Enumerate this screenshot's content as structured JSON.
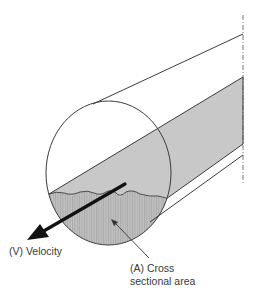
{
  "diagram": {
    "type": "pipe-flow-cross-section",
    "labels": {
      "velocity": "(V) Velocity",
      "area_line1": "(A) Cross",
      "area_line2": "sectional area"
    },
    "colors": {
      "background": "#ffffff",
      "outline": "#3c3c3c",
      "flow_band_fill": "#c8c8c8",
      "cross_section_fill": "#bdbdbd",
      "hatch_stripe": "#a9a9a9",
      "arrow": "#111111",
      "text": "#3a3a3a"
    },
    "elements": [
      "pipe-outline-upper-line",
      "pipe-outline-lower-line",
      "pipe-end-circle",
      "flow-band",
      "water-surface-line",
      "cross-section-area",
      "velocity-arrow",
      "area-leader-arrow",
      "centerline-dashdot"
    ]
  }
}
